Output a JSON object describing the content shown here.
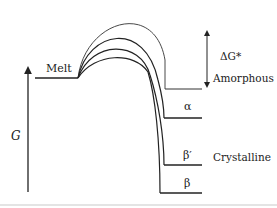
{
  "diagram": {
    "type": "free-energy-diagram",
    "axis": {
      "label": "G"
    },
    "states": [
      {
        "id": "melt",
        "label": "Melt"
      },
      {
        "id": "amorphous",
        "label": "Amorphous"
      },
      {
        "id": "alpha",
        "label": "α"
      },
      {
        "id": "beta_prime",
        "label": "β′"
      },
      {
        "id": "beta",
        "label": "β"
      }
    ],
    "group_label": "Crystalline",
    "activation_label": "ΔG*",
    "colors": {
      "line": "#222222",
      "background": "#ffffff",
      "footer_rule": "#e4e4e4"
    }
  }
}
